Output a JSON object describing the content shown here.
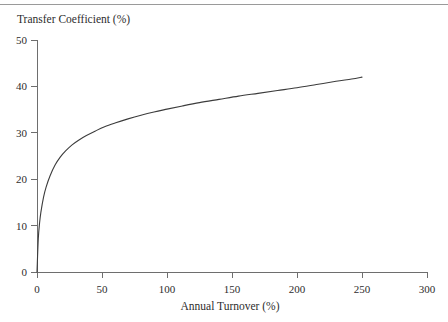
{
  "figure": {
    "name": "transfer-coefficient-vs-annual-turnover",
    "background_color": "#ffffff",
    "line_color": "#3c3c3c",
    "axis_color": "#6e6e6e",
    "rule_color": "#9a9a9a"
  },
  "chart_data": {
    "type": "line",
    "title": "",
    "xlabel": "Annual Turnover (%)",
    "ylabel": "Transfer Coefficient (%)",
    "xlim": [
      0,
      300
    ],
    "ylim": [
      0,
      50
    ],
    "xticks": [
      0,
      50,
      100,
      150,
      200,
      250,
      300
    ],
    "xticklabels": [
      "0",
      "50",
      "100",
      "150",
      "200",
      "250",
      "300"
    ],
    "yticks": [
      0,
      10,
      20,
      30,
      40,
      50
    ],
    "yticklabels": [
      "0",
      "10",
      "20",
      "30",
      "40",
      "50"
    ],
    "grid": false,
    "legend": null,
    "series": [
      {
        "name": "Transfer Coefficient",
        "x": [
          0,
          1,
          2,
          3,
          5,
          7,
          10,
          14,
          18,
          22,
          27,
          32,
          38,
          45,
          52,
          60,
          70,
          80,
          90,
          100,
          112,
          125,
          140,
          155,
          170,
          185,
          200,
          215,
          230,
          242,
          250
        ],
        "y": [
          0,
          7.2,
          10.6,
          12.9,
          16.1,
          18.3,
          20.7,
          23.1,
          24.8,
          26.1,
          27.4,
          28.4,
          29.4,
          30.4,
          31.3,
          32.1,
          33.0,
          33.8,
          34.5,
          35.1,
          35.8,
          36.5,
          37.2,
          37.9,
          38.5,
          39.1,
          39.7,
          40.4,
          41.1,
          41.6,
          42.0
        ]
      }
    ]
  },
  "axis": {
    "y_title": "Transfer Coefficient (%)",
    "x_title": "Annual Turnover (%)"
  }
}
